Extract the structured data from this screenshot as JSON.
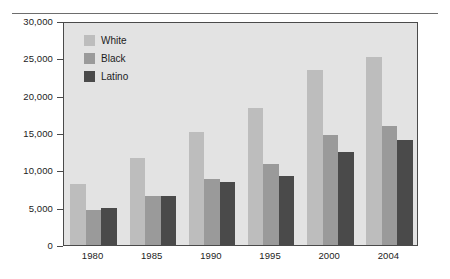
{
  "chart_data": {
    "type": "bar",
    "title": "",
    "subtitle": "",
    "xlabel": "",
    "ylabel": "",
    "categories": [
      "1980",
      "1985",
      "1990",
      "1995",
      "2000",
      "2004"
    ],
    "series": [
      {
        "name": "White",
        "color": "#bdbdbd",
        "values": [
          8200,
          11700,
          15200,
          18300,
          23400,
          25200
        ]
      },
      {
        "name": "Black",
        "color": "#9a9a9a",
        "values": [
          4700,
          6600,
          8800,
          10900,
          14700,
          15900
        ]
      },
      {
        "name": "Latino",
        "color": "#4a4a4a",
        "values": [
          4900,
          6600,
          8400,
          9200,
          12500,
          14000
        ]
      }
    ],
    "ylim": [
      0,
      30000
    ],
    "ytick_values": [
      0,
      5000,
      10000,
      15000,
      20000,
      25000,
      30000
    ],
    "ytick_labels": [
      "0",
      "5,000",
      "10,000",
      "15,000",
      "20,000",
      "25,000",
      "30,000"
    ],
    "grid": false,
    "legend_position": "top-left",
    "plot_background": "#e3e3e3",
    "frame_color": "#4a4a4a"
  },
  "legend": {
    "items": [
      {
        "label": "White"
      },
      {
        "label": "Black"
      },
      {
        "label": "Latino"
      }
    ]
  }
}
